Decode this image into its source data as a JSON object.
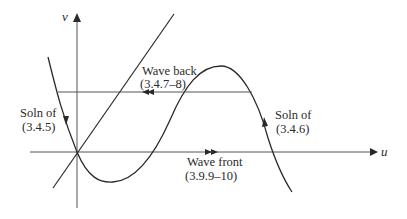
{
  "figure": {
    "axes": {
      "x_label": "u",
      "y_label": "v"
    },
    "labels": {
      "wave_back": {
        "line1": "Wave back",
        "line2": "(3.4.7–8)"
      },
      "wave_front": {
        "line1": "Wave front",
        "line2": "(3.9.9–10)"
      },
      "soln_left": {
        "line1": "Soln of",
        "line2": "(3.4.5)"
      },
      "soln_right": {
        "line1": "Soln of",
        "line2": "(3.4.6)"
      }
    },
    "curves": [
      {
        "name": "cubic-nullcline",
        "description": "N-shaped curve through origin with trough below u-axis and peak above"
      },
      {
        "name": "linear-nullcline",
        "description": "straight line through origin with positive slope"
      },
      {
        "name": "wave-back-trajectory",
        "description": "horizontal line from left branch to right branch, arrows pointing left"
      },
      {
        "name": "wave-front-trajectory",
        "description": "along u-axis from origin to right branch, arrows pointing right"
      }
    ],
    "colors": {
      "line": "#2a2a2a",
      "axis": "#555555",
      "background": "#ffffff"
    }
  }
}
